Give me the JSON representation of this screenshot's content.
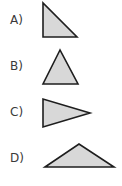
{
  "options": [
    {
      "label": "A)",
      "shape": "right-triangle",
      "fill": "#d8d8d8",
      "stroke": "#1e1e1e"
    },
    {
      "label": "B)",
      "shape": "isosceles-triangle",
      "fill": "#d8d8d8",
      "stroke": "#1e1e1e"
    },
    {
      "label": "C)",
      "shape": "triangle-pointing-right",
      "fill": "#d8d8d8",
      "stroke": "#1e1e1e"
    },
    {
      "label": "D)",
      "shape": "obtuse-triangle",
      "fill": "#d8d8d8",
      "stroke": "#1e1e1e"
    }
  ]
}
